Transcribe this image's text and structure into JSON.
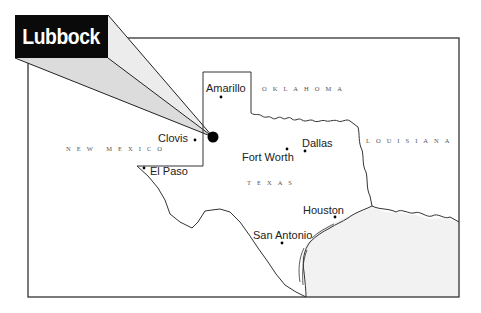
{
  "callout": {
    "label": "Lubbock"
  },
  "cities": [
    {
      "name": "Amarillo",
      "x": 221,
      "y": 97
    },
    {
      "name": "Clovis",
      "x": 195,
      "y": 140
    },
    {
      "name": "Dallas",
      "x": 305,
      "y": 151
    },
    {
      "name": "Fort Worth",
      "x": 287,
      "y": 149
    },
    {
      "name": "El Paso",
      "x": 144,
      "y": 168
    },
    {
      "name": "Houston",
      "x": 335,
      "y": 217
    },
    {
      "name": "San Antonio",
      "x": 282,
      "y": 243
    }
  ],
  "regions": {
    "oklahoma": "OKLAHOMA",
    "new_mexico": "NEW MEXICO",
    "louisiana": "LOUISIANA",
    "texas": "TEXAS"
  },
  "highlight": {
    "city": "Lubbock",
    "x": 213,
    "y": 137
  },
  "colors": {
    "callout_bg": "#0a0a0a",
    "callout_text": "#ffffff",
    "callout_wedge": "#e6e6e6",
    "gulf": "#f2f2f2",
    "line": "#333333"
  }
}
